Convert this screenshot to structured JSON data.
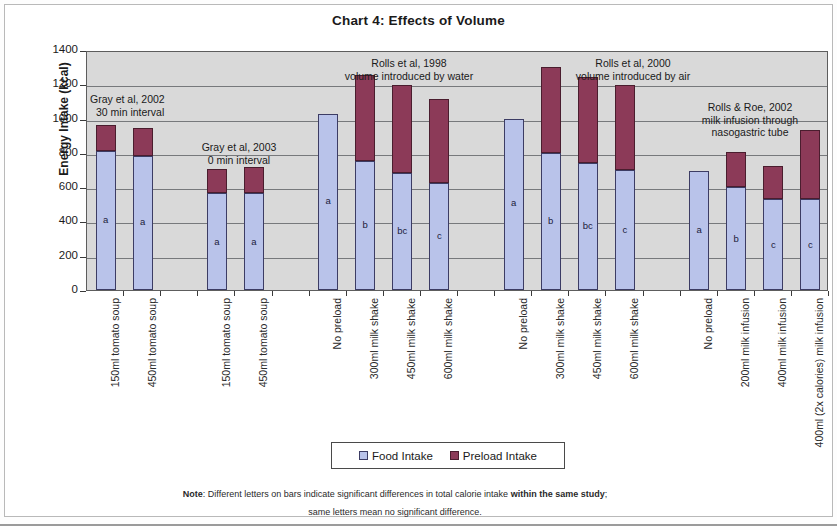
{
  "chart_data": {
    "type": "bar",
    "subtype": "stacked",
    "title": "Chart 4:  Effects of Volume",
    "xlabel": "",
    "ylabel": "Energy Intake (kcal)",
    "ylim": [
      0,
      1400
    ],
    "ytick_step": 200,
    "yticks": [
      0,
      200,
      400,
      600,
      800,
      1000,
      1200,
      1400
    ],
    "ytick_labels": [
      "0",
      "200",
      "400",
      "600",
      "800",
      "1000",
      "1200",
      "1400"
    ],
    "grid": true,
    "legend_position": "bottom-center",
    "plot_bgcolor": "#d9d9d9",
    "categories": [
      "150ml tomato soup",
      "450ml tomato soup",
      "",
      "150ml tomato soup",
      "450ml tomato soup",
      "",
      "No preload",
      "300ml milk shake",
      "450ml milk shake",
      "600ml milk shake",
      "",
      "No preload",
      "300ml milk shake",
      "450ml milk shake",
      "600ml milk shake",
      "",
      "No preload",
      "200ml milk infusion",
      "400ml milk infusion",
      "400ml (2x calories) milk infusion"
    ],
    "series": [
      {
        "name": "Food Intake",
        "color": "#b9c3ea",
        "values": [
          810,
          780,
          null,
          565,
          565,
          null,
          1025,
          750,
          685,
          625,
          null,
          995,
          800,
          740,
          700,
          null,
          695,
          600,
          530,
          530
        ]
      },
      {
        "name": "Preload Intake",
        "color": "#8c3a58",
        "values": [
          150,
          165,
          null,
          140,
          155,
          null,
          0,
          505,
          510,
          490,
          null,
          0,
          500,
          505,
          495,
          null,
          0,
          205,
          195,
          405
        ]
      }
    ],
    "totals": [
      960,
      945,
      null,
      705,
      720,
      null,
      1025,
      1255,
      1195,
      1115,
      null,
      995,
      1300,
      1245,
      1195,
      null,
      695,
      805,
      725,
      935
    ],
    "bar_labels": [
      "a",
      "a",
      null,
      "a",
      "a",
      null,
      "a",
      "b",
      "bc",
      "c",
      null,
      "a",
      "b",
      "bc",
      "c",
      null,
      "a",
      "b",
      "c",
      "c"
    ],
    "annotations": [
      {
        "id": "gray-2002",
        "lines": [
          "Gray et al, 2002",
          "30 min interval"
        ]
      },
      {
        "id": "gray-2003",
        "lines": [
          "Gray et al, 2003",
          "0 min interval"
        ]
      },
      {
        "id": "rolls-1998",
        "lines": [
          "Rolls et al, 1998",
          "volume introduced by water"
        ]
      },
      {
        "id": "rolls-2000",
        "lines": [
          "Rolls et al, 2000",
          "volume introduced by air"
        ]
      },
      {
        "id": "rolls-roe-2002",
        "lines": [
          "Rolls & Roe, 2002",
          "milk infusion through",
          "nasogastric tube"
        ]
      }
    ]
  },
  "title": "Chart 4:  Effects of Volume",
  "axis": {
    "y_title": "Energy Intake (kcal)",
    "y_labels": [
      "1400",
      "1200",
      "1000",
      "800",
      "600",
      "400",
      "200",
      "0"
    ]
  },
  "xlabels": [
    "150ml tomato soup",
    "450ml tomato soup",
    "150ml tomato soup",
    "450ml tomato soup",
    "No preload",
    "300ml milk shake",
    "450ml milk shake",
    "600ml milk shake",
    "No preload",
    "300ml milk shake",
    "450ml milk shake",
    "600ml milk shake",
    "No preload",
    "200ml milk infusion",
    "400ml milk infusion",
    "400ml (2x calories) milk infusion"
  ],
  "annotations": {
    "gray2002_l1": "Gray et al, 2002",
    "gray2002_l2": "30 min interval",
    "gray2003_l1": "Gray et al, 2003",
    "gray2003_l2": "0 min interval",
    "rolls1998_l1": "Rolls et al, 1998",
    "rolls1998_l2": "volume introduced by water",
    "rolls2000_l1": "Rolls et al, 2000",
    "rolls2000_l2": "volume introduced by air",
    "rollsroe_l1": "Rolls & Roe, 2002",
    "rollsroe_l2": "milk infusion through",
    "rollsroe_l3": "nasogastric tube"
  },
  "legend": {
    "food_label": "Food Intake",
    "preload_label": "Preload Intake"
  },
  "note": {
    "prefix": "Note",
    "line1a": ": Different letters on bars indicate significant differences in total calorie intake ",
    "line1b": "within the same study",
    "line1c": ";",
    "line2": "same letters mean no significant difference."
  }
}
